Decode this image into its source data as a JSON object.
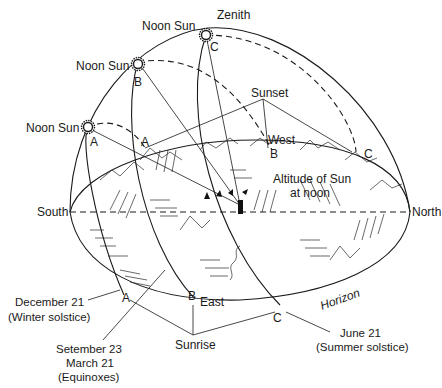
{
  "diagram": {
    "labels": {
      "zenith": "Zenith",
      "noon_sun_c": "Noon Sun",
      "noon_sun_b": "Noon Sun",
      "noon_sun_a": "Noon Sun",
      "sunset": "Sunset",
      "west": "West",
      "east": "East",
      "south": "South",
      "north": "North",
      "horizon": "Horizon",
      "sunrise": "Sunrise",
      "altitude_line1": "Altitude of Sun",
      "altitude_line2": "at noon",
      "dec_line1": "December 21",
      "dec_line2": "(Winter solstice)",
      "equinox_line1": "Setember 23",
      "equinox_line2": "March 21",
      "equinox_line3": "(Equinoxes)",
      "june_line1": "June 21",
      "june_line2": "(Summer solstice)"
    },
    "points": {
      "a_noon": "A",
      "b_noon": "B",
      "c_noon": "C",
      "a_sunset": "A",
      "b_sunset": "B",
      "c_sunset": "C",
      "a_sunrise": "A",
      "b_sunrise": "B",
      "c_sunrise": "C"
    },
    "sun_paths": [
      {
        "id": "A",
        "date": "December 21",
        "season": "Winter solstice"
      },
      {
        "id": "B",
        "date": "Setember 23 / March 21",
        "season": "Equinoxes"
      },
      {
        "id": "C",
        "date": "June 21",
        "season": "Summer solstice"
      }
    ]
  }
}
